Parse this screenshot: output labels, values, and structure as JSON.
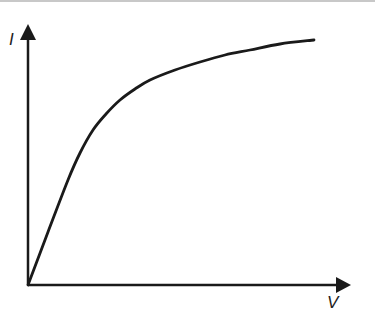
{
  "diagram": {
    "type": "line",
    "title": "",
    "ylabel": "I",
    "xlabel": "V",
    "line_color": "#1a1a1a",
    "curve_points": [
      [
        28,
        285
      ],
      [
        48,
        232
      ],
      [
        68,
        180
      ],
      [
        80,
        153
      ],
      [
        93,
        130
      ],
      [
        106,
        114
      ],
      [
        120,
        100
      ],
      [
        135,
        89
      ],
      [
        150,
        80
      ],
      [
        175,
        70
      ],
      [
        200,
        62
      ],
      [
        225,
        55
      ],
      [
        250,
        50
      ],
      [
        280,
        44
      ],
      [
        314,
        40
      ]
    ]
  },
  "chart_data": {
    "type": "line",
    "title": "",
    "xlabel": "V",
    "ylabel": "I",
    "grid": false,
    "legend": null,
    "series": [
      {
        "name": "I(V)",
        "x": [
          0,
          0.06,
          0.12,
          0.16,
          0.2,
          0.24,
          0.28,
          0.33,
          0.38,
          0.46,
          0.53,
          0.61,
          0.68,
          0.78,
          0.88
        ],
        "y": [
          0,
          0.21,
          0.41,
          0.52,
          0.61,
          0.67,
          0.73,
          0.77,
          0.81,
          0.85,
          0.88,
          0.9,
          0.92,
          0.95,
          0.96
        ]
      }
    ],
    "xlim": [
      0,
      1
    ],
    "ylim": [
      0,
      1
    ]
  }
}
